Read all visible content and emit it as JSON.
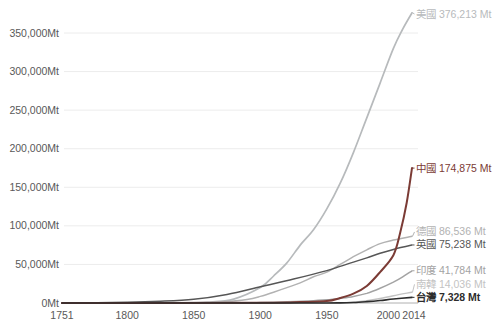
{
  "page": {
    "background": "#ffffff"
  },
  "chart_data": {
    "type": "line",
    "title": "",
    "unit": "Mt",
    "grid": "horizontal",
    "legend_position": "right-edge-labels",
    "x_axis": {
      "min": 1751,
      "max": 2014,
      "ticks": [
        1751,
        1800,
        1850,
        1900,
        1950,
        2000,
        2014
      ]
    },
    "y_axis": {
      "tick_values": [
        0,
        50000,
        100000,
        150000,
        200000,
        250000,
        300000,
        350000
      ],
      "tick_labels": [
        "0Mt",
        "50,000Mt",
        "100,000Mt",
        "150,000Mt",
        "200,000Mt",
        "250,000Mt",
        "300,000Mt",
        "350,000Mt"
      ],
      "max_value": 350000
    },
    "colors": {
      "gridline": "#ececec",
      "axis_line": "#b0b0b0",
      "tick_text": "#595959"
    },
    "series": [
      {
        "id": "usa",
        "name": "美國",
        "total": 376213,
        "label": "美國 376,213 Mt",
        "color": "#b7babc",
        "bold": false,
        "width": 1.7,
        "points": [
          [
            1751,
            0
          ],
          [
            1800,
            30
          ],
          [
            1840,
            200
          ],
          [
            1860,
            1200
          ],
          [
            1880,
            5000
          ],
          [
            1900,
            20000
          ],
          [
            1910,
            35000
          ],
          [
            1920,
            52000
          ],
          [
            1930,
            75000
          ],
          [
            1940,
            95000
          ],
          [
            1950,
            122000
          ],
          [
            1960,
            155000
          ],
          [
            1970,
            195000
          ],
          [
            1980,
            240000
          ],
          [
            1990,
            285000
          ],
          [
            2000,
            330000
          ],
          [
            2007,
            355000
          ],
          [
            2014,
            376213
          ]
        ]
      },
      {
        "id": "south-korea",
        "name": "南韓",
        "total": 14036,
        "label": "南韓 14,036 Mt",
        "color": "#c3c3c3",
        "bold": false,
        "width": 1.5,
        "points": [
          [
            1751,
            0
          ],
          [
            1900,
            0
          ],
          [
            1950,
            100
          ],
          [
            1960,
            300
          ],
          [
            1970,
            1000
          ],
          [
            1980,
            2800
          ],
          [
            1990,
            5800
          ],
          [
            2000,
            9500
          ],
          [
            2014,
            14036
          ]
        ]
      },
      {
        "id": "india",
        "name": "印度",
        "total": 41784,
        "label": "印度 41,784 Mt",
        "color": "#a3a3a3",
        "bold": false,
        "width": 1.5,
        "points": [
          [
            1751,
            0
          ],
          [
            1880,
            200
          ],
          [
            1900,
            600
          ],
          [
            1920,
            1500
          ],
          [
            1940,
            3000
          ],
          [
            1950,
            4200
          ],
          [
            1960,
            6000
          ],
          [
            1970,
            8500
          ],
          [
            1980,
            12500
          ],
          [
            1990,
            19000
          ],
          [
            2000,
            27000
          ],
          [
            2007,
            34000
          ],
          [
            2014,
            41784
          ]
        ]
      },
      {
        "id": "germany",
        "name": "德國",
        "total": 86536,
        "label": "德國 86,536 Mt",
        "color": "#b2b2b2",
        "bold": false,
        "width": 1.5,
        "points": [
          [
            1751,
            0
          ],
          [
            1850,
            250
          ],
          [
            1870,
            1200
          ],
          [
            1890,
            4500
          ],
          [
            1900,
            8500
          ],
          [
            1910,
            14000
          ],
          [
            1920,
            20000
          ],
          [
            1930,
            26000
          ],
          [
            1940,
            34000
          ],
          [
            1950,
            40000
          ],
          [
            1960,
            50000
          ],
          [
            1970,
            60000
          ],
          [
            1980,
            69000
          ],
          [
            1990,
            77000
          ],
          [
            2000,
            81500
          ],
          [
            2014,
            86536
          ]
        ]
      },
      {
        "id": "uk",
        "name": "英國",
        "total": 75238,
        "label": "英國 75,238 Mt",
        "color": "#565656",
        "bold": false,
        "width": 1.5,
        "points": [
          [
            1751,
            0
          ],
          [
            1800,
            900
          ],
          [
            1825,
            2200
          ],
          [
            1850,
            4800
          ],
          [
            1875,
            11000
          ],
          [
            1900,
            21000
          ],
          [
            1925,
            31000
          ],
          [
            1950,
            42000
          ],
          [
            1960,
            47500
          ],
          [
            1970,
            53000
          ],
          [
            1980,
            58500
          ],
          [
            1990,
            64500
          ],
          [
            2000,
            69500
          ],
          [
            2014,
            75238
          ]
        ]
      },
      {
        "id": "china",
        "name": "中國",
        "total": 174875,
        "label": "中國 174,875 Mt",
        "color": "#7b3b35",
        "bold": false,
        "width": 2,
        "points": [
          [
            1751,
            0
          ],
          [
            1900,
            300
          ],
          [
            1930,
            1200
          ],
          [
            1950,
            2500
          ],
          [
            1960,
            6500
          ],
          [
            1970,
            12000
          ],
          [
            1980,
            22000
          ],
          [
            1990,
            40000
          ],
          [
            2000,
            62000
          ],
          [
            2005,
            90000
          ],
          [
            2010,
            130000
          ],
          [
            2014,
            174875
          ]
        ]
      },
      {
        "id": "taiwan",
        "name": "台灣",
        "total": 7328,
        "label": "台灣 7,328 Mt",
        "color": "#2d2d2d",
        "bold": true,
        "width": 1.7,
        "points": [
          [
            1751,
            0
          ],
          [
            1900,
            0
          ],
          [
            1950,
            60
          ],
          [
            1960,
            200
          ],
          [
            1970,
            600
          ],
          [
            1980,
            1700
          ],
          [
            1990,
            3200
          ],
          [
            2000,
            5200
          ],
          [
            2014,
            7328
          ]
        ]
      }
    ]
  }
}
